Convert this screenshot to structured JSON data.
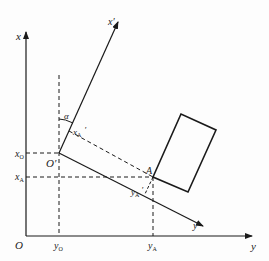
{
  "diagram": {
    "type": "coordinate-transformation",
    "labels": {
      "x_axis": "x",
      "y_axis": "y",
      "origin": "O",
      "x_prime_axis": "x′",
      "y_prime_axis": "y′",
      "origin_prime": "O′",
      "alpha": "α",
      "point_a": "A",
      "x_o": "x",
      "x_o_sub": "O",
      "x_a": "x",
      "x_a_sub": "A",
      "y_o": "y",
      "y_o_sub": "O",
      "y_a": "y",
      "y_a_sub": "A",
      "x_a_prime": "x",
      "x_a_prime_sub": "A",
      "x_a_prime_mark": "′",
      "y_a_prime": "y",
      "y_a_prime_sub": "A",
      "y_a_prime_mark": "′"
    },
    "colors": {
      "line": "#1a1a1a",
      "background": "#fdfdfd"
    }
  }
}
